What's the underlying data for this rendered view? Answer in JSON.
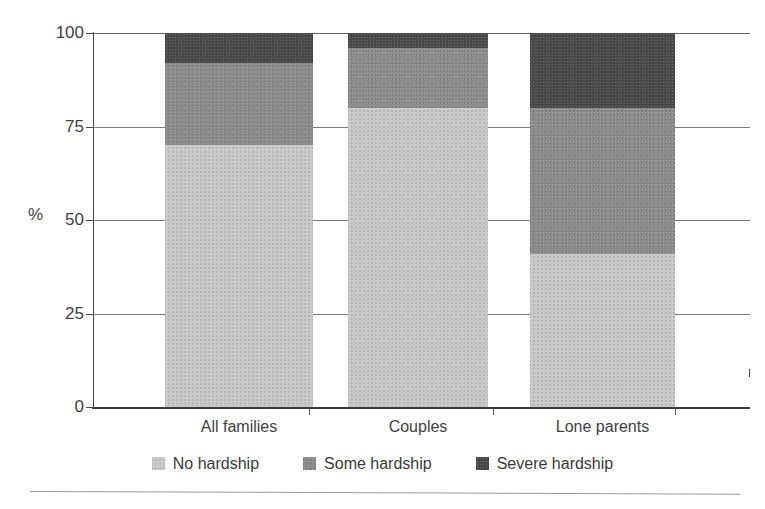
{
  "figure": {
    "ghost_text": "",
    "footer_rule": "horizontal-rule"
  },
  "axis": {
    "unit_label": "%",
    "y_ticks": [
      "100",
      "75",
      "50",
      "25",
      "0"
    ],
    "category_labels": [
      "All families",
      "Couples",
      "Lone parents"
    ]
  },
  "legend": {
    "items": [
      {
        "label": "No hardship",
        "color": "#c8c8c8"
      },
      {
        "label": "Some hardship",
        "color": "#8c8c8c"
      },
      {
        "label": "Severe hardship",
        "color": "#4a4a4a"
      }
    ]
  },
  "chart_data": {
    "type": "bar",
    "title": "",
    "subtitle": "",
    "xlabel": "",
    "ylabel": "%",
    "ylim": [
      0,
      100
    ],
    "yticks": [
      0,
      25,
      50,
      75,
      100
    ],
    "grid": true,
    "stacked": true,
    "legend_position": "bottom",
    "categories": [
      "All families",
      "Couples",
      "Lone parents"
    ],
    "series": [
      {
        "name": "No hardship",
        "color": "#c8c8c8",
        "values": [
          70,
          80,
          41
        ]
      },
      {
        "name": "Some hardship",
        "color": "#8c8c8c",
        "values": [
          22,
          16,
          39
        ]
      },
      {
        "name": "Severe hardship",
        "color": "#4a4a4a",
        "values": [
          8,
          4,
          20
        ]
      }
    ]
  }
}
